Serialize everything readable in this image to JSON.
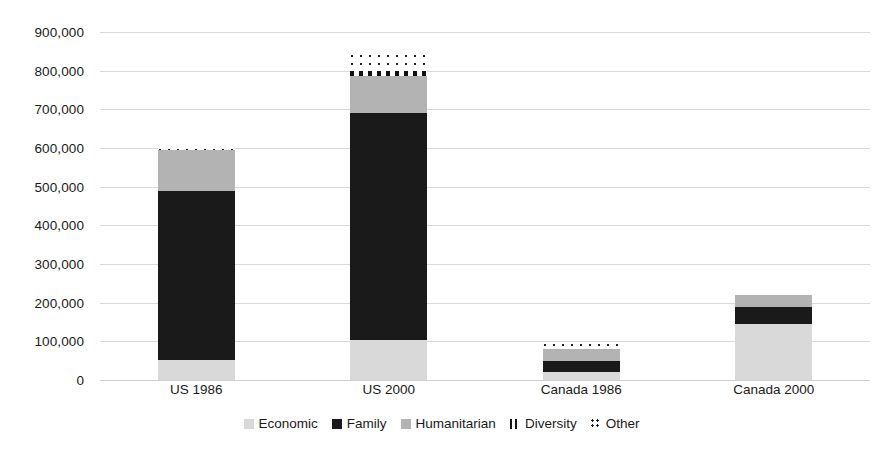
{
  "chart_data": {
    "type": "bar",
    "stacked": true,
    "title": "",
    "xlabel": "",
    "ylabel": "",
    "ylim": [
      0,
      900000
    ],
    "ytick_step": 100000,
    "grid": true,
    "legend_position": "bottom",
    "categories": [
      "US 1986",
      "US 2000",
      "Canada 1986",
      "Canada 2000"
    ],
    "ytick_labels": [
      "0",
      "100,000",
      "200,000",
      "300,000",
      "400,000",
      "500,000",
      "600,000",
      "700,000",
      "800,000",
      "900,000"
    ],
    "ytick_values": [
      0,
      100000,
      200000,
      300000,
      400000,
      500000,
      600000,
      700000,
      800000,
      900000
    ],
    "series": [
      {
        "name": "Economic",
        "pattern": "solid-light-gray",
        "color": "#d9d9d9",
        "values": [
          52000,
          103000,
          20000,
          145000
        ]
      },
      {
        "name": "Family",
        "pattern": "solid-black",
        "color": "#1a1a1a",
        "values": [
          437000,
          587000,
          30000,
          45000
        ]
      },
      {
        "name": "Humanitarian",
        "pattern": "solid-gray",
        "color": "#b3b3b3",
        "values": [
          105000,
          97000,
          30000,
          30000
        ]
      },
      {
        "name": "Diversity",
        "pattern": "vertical-stripes",
        "color": "#111111",
        "values": [
          0,
          13000,
          0,
          0
        ]
      },
      {
        "name": "Other",
        "pattern": "dots",
        "color": "#222222",
        "values": [
          7000,
          43000,
          15000,
          0
        ]
      }
    ],
    "totals": [
      601000,
      843000,
      95000,
      220000
    ]
  },
  "legend": {
    "items": [
      {
        "label": "Economic",
        "swatch": "swatch-economic-icon"
      },
      {
        "label": "Family",
        "swatch": "swatch-family-icon"
      },
      {
        "label": "Humanitarian",
        "swatch": "swatch-humanitarian-icon"
      },
      {
        "label": "Diversity",
        "swatch": "swatch-diversity-icon"
      },
      {
        "label": "Other",
        "swatch": "swatch-other-icon"
      }
    ]
  }
}
